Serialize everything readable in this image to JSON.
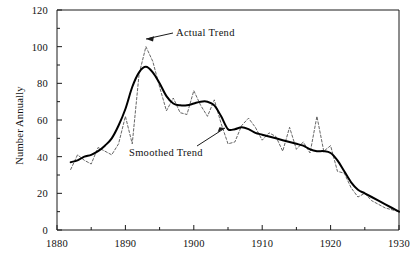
{
  "chart_data": {
    "type": "line",
    "title": "",
    "xlabel": "",
    "ylabel": "Number Annually",
    "xlim": [
      1880,
      1930
    ],
    "ylim": [
      0,
      120
    ],
    "grid": false,
    "legend_position": "inline-annotations",
    "x_ticks": [
      1880,
      1890,
      1900,
      1910,
      1920,
      1930
    ],
    "x_minor_ticks": [
      1885,
      1895,
      1905,
      1915,
      1925
    ],
    "y_ticks": [
      0,
      20,
      40,
      60,
      80,
      100,
      120
    ],
    "y_minor_ticks": [
      10,
      30,
      50,
      70,
      90,
      110
    ],
    "annotations": [
      {
        "text": "Actual Trend",
        "points_to_x": 1891,
        "points_to_y": 100
      },
      {
        "text": "Smoothed Trend",
        "points_to_x": 1905,
        "points_to_y": 55
      }
    ],
    "x": [
      1882,
      1883,
      1884,
      1885,
      1886,
      1887,
      1888,
      1889,
      1890,
      1891,
      1892,
      1893,
      1894,
      1895,
      1896,
      1897,
      1898,
      1899,
      1900,
      1901,
      1902,
      1903,
      1904,
      1905,
      1906,
      1907,
      1908,
      1909,
      1910,
      1911,
      1912,
      1913,
      1914,
      1915,
      1916,
      1917,
      1918,
      1919,
      1920,
      1921,
      1922,
      1923,
      1924,
      1925,
      1926,
      1927,
      1928,
      1929,
      1930
    ],
    "series": [
      {
        "name": "Actual Trend",
        "style": "dashed",
        "color": "#555555",
        "values": [
          33,
          41,
          38,
          36,
          45,
          43,
          41,
          47,
          62,
          47,
          85,
          100,
          92,
          78,
          65,
          72,
          64,
          63,
          76,
          68,
          62,
          71,
          58,
          47,
          48,
          57,
          61,
          56,
          49,
          53,
          51,
          43,
          56,
          44,
          48,
          42,
          62,
          43,
          46,
          32,
          31,
          23,
          18,
          20,
          16,
          14,
          12,
          11,
          10
        ]
      },
      {
        "name": "Smoothed Trend",
        "style": "solid",
        "color": "#000000",
        "values": [
          37,
          38,
          40,
          41,
          43,
          46,
          50,
          57,
          66,
          78,
          86,
          89,
          86,
          80,
          73,
          69,
          68,
          68,
          69,
          70,
          70,
          68,
          62,
          55,
          55,
          56,
          55,
          53,
          52,
          51,
          50,
          49,
          48,
          47,
          46,
          44,
          43,
          43,
          42,
          38,
          32,
          26,
          22,
          20,
          18,
          16,
          14,
          12,
          10
        ]
      }
    ]
  },
  "axes": {
    "y_labels": [
      "120",
      "100",
      "80",
      "60",
      "40",
      "20",
      "0"
    ],
    "x_labels": [
      "1880",
      "1890",
      "1900",
      "1910",
      "1920",
      "1930"
    ],
    "y_axis_title": "Number Annually"
  },
  "annotations": {
    "actual_trend": "Actual Trend",
    "smoothed_trend": "Smoothed Trend"
  }
}
